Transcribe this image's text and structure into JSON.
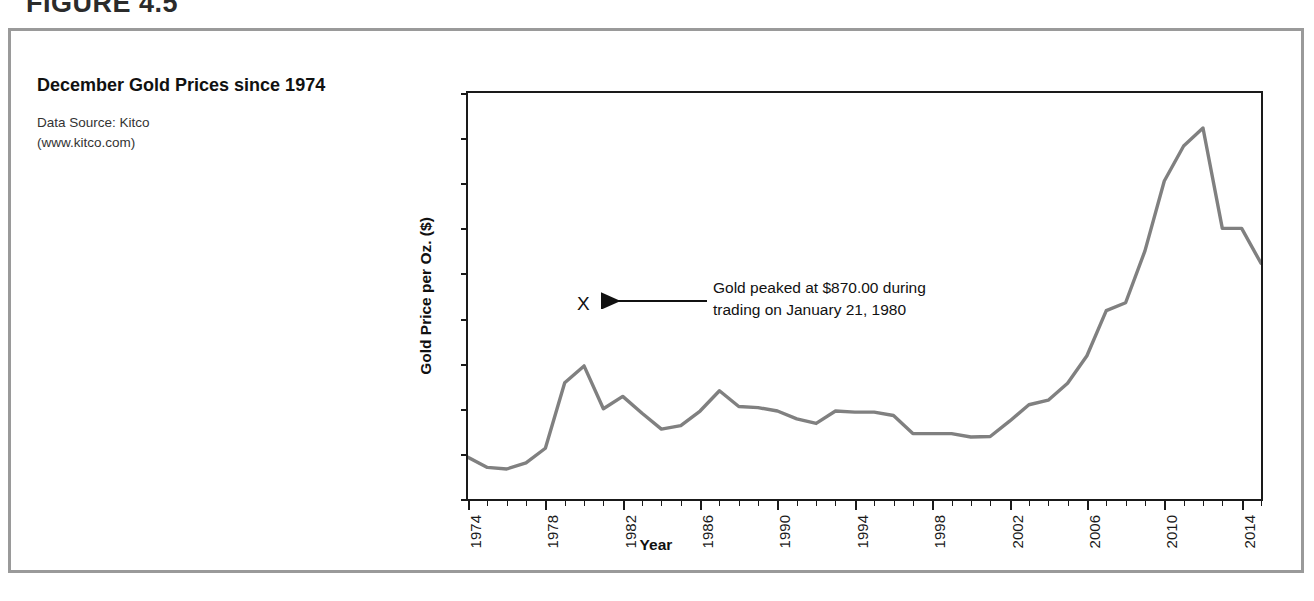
{
  "figure": {
    "heading": "FIGURE 4.5"
  },
  "caption": {
    "title": "December Gold Prices since 1974",
    "source_line1": "Data Source: Kitco",
    "source_line2": "(www.kitco.com)"
  },
  "annotation": {
    "marker": "X",
    "line1": "Gold peaked at $870.00 during",
    "line2": "trading on January 21, 1980",
    "peak_value": 870.0,
    "peak_date": "January 21, 1980"
  },
  "colors": {
    "series_line": "#808080",
    "axis": "#1a1a1a",
    "panel_border": "#9a9a9a",
    "text": "#1a1a1a"
  },
  "chart_data": {
    "type": "line",
    "title": "December Gold Prices since 1974",
    "xlabel": "Year",
    "ylabel": "Gold Price per Oz. ($)",
    "ylim": [
      0,
      1800
    ],
    "ytick_step": 200,
    "ytick_labels": [
      "0.00",
      "200.00",
      "400.00",
      "600.00",
      "800.00",
      "1,000.00",
      "1,200.00",
      "1,400.00",
      "1,600.00",
      "1,800.00"
    ],
    "ytick_values": [
      0,
      200,
      400,
      600,
      800,
      1000,
      1200,
      1400,
      1600,
      1800
    ],
    "xlim": [
      1974,
      2015
    ],
    "xtick_step": 1,
    "xlabel_step": 4,
    "xtick_labels": [
      "1974",
      "1978",
      "1982",
      "1986",
      "1990",
      "1994",
      "1998",
      "2002",
      "2006",
      "2010",
      "2014"
    ],
    "xtick_label_values": [
      1974,
      1978,
      1982,
      1986,
      1990,
      1994,
      1998,
      2002,
      2006,
      2010,
      2014
    ],
    "grid": false,
    "legend": "none",
    "series": [
      {
        "name": "December Gold Price per Oz.",
        "x": [
          1974,
          1975,
          1976,
          1977,
          1978,
          1979,
          1980,
          1981,
          1982,
          1983,
          1984,
          1985,
          1986,
          1987,
          1988,
          1989,
          1990,
          1991,
          1992,
          1993,
          1994,
          1995,
          1996,
          1997,
          1998,
          1999,
          2000,
          2001,
          2002,
          2003,
          2004,
          2005,
          2006,
          2007,
          2008,
          2009,
          2010,
          2011,
          2012,
          2013,
          2014,
          2015
        ],
        "values": [
          185,
          140,
          133,
          160,
          225,
          515,
          590,
          400,
          455,
          380,
          310,
          325,
          390,
          480,
          410,
          405,
          390,
          355,
          335,
          390,
          385,
          385,
          370,
          290,
          290,
          290,
          275,
          277,
          345,
          418,
          438,
          513,
          635,
          835,
          870,
          1100,
          1410,
          1565,
          1645,
          1200,
          1200,
          1045
        ]
      }
    ]
  }
}
